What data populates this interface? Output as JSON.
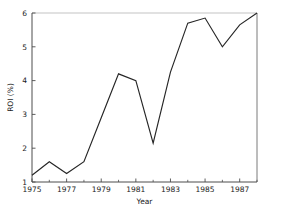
{
  "chart_data": {
    "type": "line",
    "title": "",
    "xlabel": "Year",
    "ylabel": "ROI (%)",
    "x": [
      1975,
      1976,
      1977,
      1978,
      1979,
      1980,
      1981,
      1982,
      1983,
      1984,
      1985,
      1986,
      1987,
      1988
    ],
    "values": [
      1.2,
      1.6,
      1.25,
      1.6,
      2.9,
      4.2,
      4.0,
      2.15,
      4.25,
      5.7,
      5.85,
      5.0,
      5.65,
      6.0
    ],
    "series": [
      {
        "name": "ROI",
        "values": [
          1.2,
          1.6,
          1.25,
          1.6,
          2.9,
          4.2,
          4.0,
          2.15,
          4.25,
          5.7,
          5.85,
          5.0,
          5.65,
          6.0
        ]
      }
    ],
    "xlim": [
      1975,
      1988
    ],
    "ylim": [
      1,
      6
    ],
    "xticks": [
      1975,
      1977,
      1979,
      1981,
      1983,
      1985,
      1987
    ],
    "xticklabels": [
      "1975",
      "1977",
      "1979",
      "1981",
      "1983",
      "1985",
      "1987"
    ],
    "xminorticks": [
      1976,
      1978,
      1980,
      1982,
      1984,
      1986,
      1988
    ],
    "yticks": [
      1,
      2,
      3,
      4,
      5,
      6
    ],
    "yticklabels": [
      "1",
      "2",
      "3",
      "4",
      "5",
      "6"
    ],
    "grid": false,
    "legend": false,
    "line_color": "#262626",
    "axis_color": "#4d4d4d",
    "frame_top_color": "#c4c4c4",
    "background": "#ffffff"
  },
  "axes": {
    "x_title": "Year",
    "y_title": "ROI (%)"
  },
  "ticks": {
    "x": [
      "1975",
      "1977",
      "1979",
      "1981",
      "1983",
      "1985",
      "1987"
    ],
    "y": [
      "1",
      "2",
      "3",
      "4",
      "5",
      "6"
    ]
  }
}
